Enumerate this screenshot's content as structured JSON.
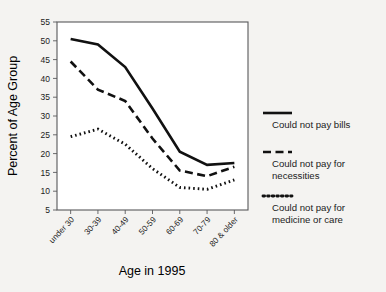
{
  "chart_data": {
    "type": "line",
    "title": "",
    "xlabel": "Age in 1995",
    "ylabel": "Percent of Age Group",
    "categories": [
      "under 30",
      "30-39",
      "40-49",
      "50-59",
      "60-69",
      "70-79",
      "80 & older"
    ],
    "ylim": [
      5,
      55
    ],
    "ytick_step": 5,
    "yticks": [
      5,
      10,
      15,
      20,
      25,
      30,
      35,
      40,
      45,
      50,
      55
    ],
    "grid": false,
    "legend_position": "right",
    "series": [
      {
        "name": "Could not pay bills",
        "style": "solid",
        "values": [
          50.5,
          49.0,
          43.0,
          32.0,
          20.5,
          17.0,
          17.5
        ]
      },
      {
        "name": "Could not pay for necessities",
        "style": "dashed",
        "values": [
          44.5,
          37.0,
          34.0,
          24.0,
          15.5,
          14.0,
          16.5
        ]
      },
      {
        "name": "Could not pay for medicine or care",
        "style": "dotted",
        "values": [
          24.5,
          26.5,
          22.5,
          16.0,
          11.0,
          10.5,
          13.0
        ]
      }
    ]
  },
  "legend": {
    "items": [
      {
        "label_line1": "Could not pay bills",
        "label_line2": ""
      },
      {
        "label_line1": "Could not pay for",
        "label_line2": "necessities"
      },
      {
        "label_line1": "Could not pay for",
        "label_line2": "medicine or care"
      }
    ]
  },
  "colors": {
    "background": "#f4f3f1",
    "plot_background": "#ffffff",
    "line": "#111111",
    "axis": "#58585a",
    "text": "#1b1b1b"
  }
}
